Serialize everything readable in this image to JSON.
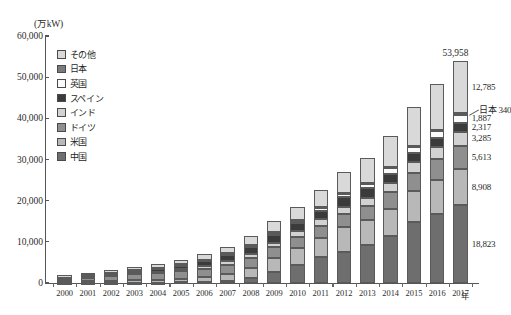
{
  "chart_data": {
    "type": "bar",
    "stacked": true,
    "title": "",
    "ylabel": "(万kW)",
    "xlabel": "年",
    "ylim": [
      0,
      60000
    ],
    "ytick_values": [
      0,
      10000,
      20000,
      30000,
      40000,
      50000,
      60000
    ],
    "ytick_labels": [
      "0",
      "10,000",
      "20,000",
      "30,000",
      "40,000",
      "50,000",
      "60,000"
    ],
    "grid": false,
    "legend_position": "upper-left-inside",
    "categories": [
      "2000",
      "2001",
      "2002",
      "2003",
      "2004",
      "2005",
      "2006",
      "2007",
      "2008",
      "2009",
      "2010",
      "2011",
      "2012",
      "2013",
      "2014",
      "2015",
      "2016",
      "2017"
    ],
    "series": [
      {
        "name": "中国",
        "color": "#6e6e6e",
        "values": [
          35,
          40,
          47,
          57,
          76,
          126,
          260,
          590,
          1215,
          2580,
          4473,
          6236,
          7532,
          9141,
          11462,
          14864,
          16877,
          18823
        ]
      },
      {
        "name": "米国",
        "color": "#b8b8b8",
        "values": [
          254,
          400,
          474,
          615,
          673,
          915,
          1160,
          1660,
          2540,
          3518,
          4018,
          4692,
          6010,
          6116,
          6610,
          7410,
          8208,
          8908
        ]
      },
      {
        "name": "ドイツ",
        "color": "#8f8f8f",
        "values": [
          614,
          881,
          1200,
          1463,
          1671,
          1842,
          2074,
          2239,
          2390,
          2589,
          2720,
          2905,
          3125,
          3424,
          3970,
          4513,
          4994,
          5613
        ]
      },
      {
        "name": "インド",
        "color": "#d2d2d2",
        "values": [
          122,
          150,
          172,
          221,
          301,
          437,
          621,
          792,
          969,
          1096,
          1300,
          1603,
          1838,
          2015,
          2244,
          2509,
          2870,
          3285
        ]
      },
      {
        "name": "スペイン",
        "color": "#3b3b3b",
        "values": [
          217,
          337,
          503,
          639,
          837,
          996,
          1159,
          1510,
          1679,
          1912,
          2051,
          2170,
          2279,
          2296,
          2299,
          2301,
          2308,
          2317
        ]
      },
      {
        "name": "英国",
        "color": "#fbfbfb",
        "values": [
          41,
          48,
          57,
          66,
          89,
          139,
          196,
          260,
          358,
          425,
          524,
          648,
          853,
          1053,
          1265,
          1386,
          1600,
          1887
        ]
      },
      {
        "name": "日本",
        "color": "#7a7a7a",
        "values": [
          14,
          25,
          42,
          65,
          92,
          108,
          149,
          168,
          187,
          208,
          230,
          250,
          262,
          271,
          294,
          312,
          325,
          340
        ]
      },
      {
        "name": "その他",
        "color": "#d9d9d9",
        "values": [
          568,
          600,
          700,
          810,
          950,
          1100,
          1350,
          1600,
          2080,
          2620,
          3130,
          4030,
          5020,
          6160,
          7580,
          9490,
          11040,
          12785
        ]
      }
    ],
    "totals": [
      1865,
      2481,
      3195,
      3936,
      4689,
      5663,
      6969,
      8819,
      11418,
      14948,
      18446,
      22534,
      26919,
      30476,
      35724,
      42785,
      48222,
      53958
    ],
    "annotations": {
      "total_2017": "53,958",
      "segments_2017": [
        {
          "label": "12,785",
          "series": "その他"
        },
        {
          "label": "日本 340",
          "series": "日本",
          "leader": true
        },
        {
          "label": "1,887",
          "series": "英国"
        },
        {
          "label": "2,317",
          "series": "スペイン"
        },
        {
          "label": "3,285",
          "series": "インド"
        },
        {
          "label": "5,613",
          "series": "ドイツ"
        },
        {
          "label": "8,908",
          "series": "米国"
        },
        {
          "label": "18,823",
          "series": "中国"
        }
      ]
    }
  },
  "caption": ""
}
